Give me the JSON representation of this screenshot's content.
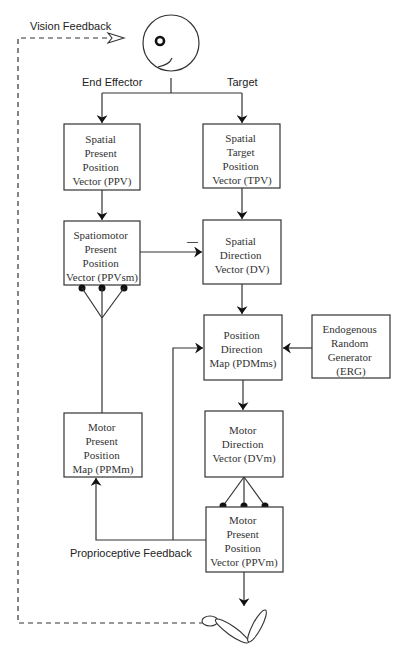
{
  "diagram": {
    "labels": {
      "vision_feedback": "Vision Feedback",
      "end_effector": "End Effector",
      "target": "Target",
      "proprioceptive_feedback": "Proprioceptive Feedback",
      "minus_sign": "—"
    },
    "boxes": {
      "ppv": {
        "lines": [
          "Spatial",
          "Present",
          "Position",
          "Vector (PPV)"
        ]
      },
      "tpv": {
        "lines": [
          "Spatial",
          "Target",
          "Position",
          "Vector (TPV)"
        ]
      },
      "ppvsm": {
        "lines": [
          "Spatiomotor",
          "Present",
          "Position",
          "Vector (PPVsm)"
        ]
      },
      "dv": {
        "lines": [
          "Spatial",
          "Direction",
          "Vector (DV)"
        ]
      },
      "pdmms": {
        "lines": [
          "Position",
          "Direction",
          "Map (PDMms)"
        ]
      },
      "erg": {
        "lines": [
          "Endogenous",
          "Random",
          "Generator",
          "(ERG)"
        ]
      },
      "ppmm": {
        "lines": [
          "Motor",
          "Present",
          "Position",
          "Map (PPMm)"
        ]
      },
      "dvm": {
        "lines": [
          "Motor",
          "Direction",
          "Vector (DVm)"
        ]
      },
      "ppvm": {
        "lines": [
          "Motor",
          "Present",
          "Position",
          "Vector (PPVm)"
        ]
      }
    },
    "icons": {
      "eye": "eye-icon",
      "arm": "arm-icon"
    }
  }
}
